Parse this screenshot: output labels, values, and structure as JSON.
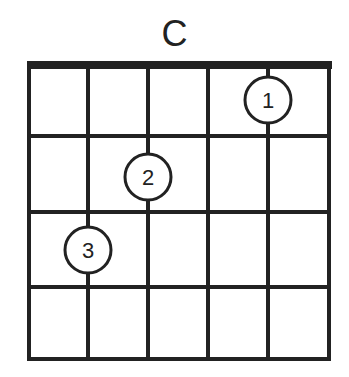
{
  "chord": {
    "name": "C",
    "strings": 6,
    "frets_shown": 4,
    "fingers": [
      {
        "finger": "1",
        "string": 5,
        "fret": 1
      },
      {
        "finger": "2",
        "string": 3,
        "fret": 2
      },
      {
        "finger": "3",
        "string": 2,
        "fret": 3
      }
    ]
  },
  "colors": {
    "line": "#222222",
    "background": "#ffffff"
  }
}
